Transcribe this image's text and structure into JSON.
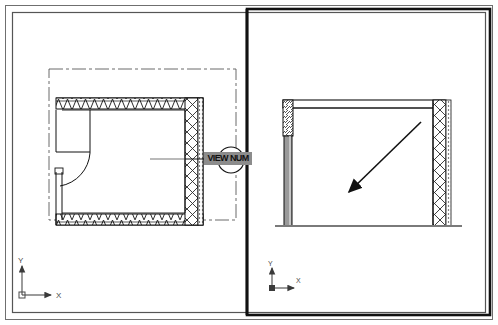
{
  "drawing": {
    "title": "CAD Viewport Drawing",
    "background_color": "#ffffff",
    "line_color": "#1a1a1a",
    "hatch_color": "#2b2b2b",
    "gray_fill": "#8c8c8c",
    "width": 498,
    "height": 325
  },
  "border": {
    "outer_name": "sheet-outer-border",
    "inner_name": "sheet-inner-border"
  },
  "viewports": [
    {
      "id": "left",
      "name": "plan-view-viewport",
      "kind": "plan",
      "ucs": {
        "x_label": "X",
        "y_label": "Y",
        "origin_x": 22,
        "origin_y": 295
      },
      "elements": [
        {
          "name": "centerline-boundary",
          "type": "dash-dot-rectangle"
        },
        {
          "name": "top-wall-truss",
          "type": "zigzag-hatch"
        },
        {
          "name": "bottom-wall-truss",
          "type": "zigzag-hatch"
        },
        {
          "name": "right-wall-lattice",
          "type": "x-lattice-hatch"
        },
        {
          "name": "door-swing-arc",
          "type": "arc"
        }
      ]
    },
    {
      "id": "right",
      "name": "elevation-view-viewport",
      "kind": "elevation",
      "ucs": {
        "x_label": "X",
        "y_label": "Y",
        "origin_x": 270,
        "origin_y": 288
      },
      "elements": [
        {
          "name": "top-beam",
          "type": "beam"
        },
        {
          "name": "left-column-diagonal-hatch",
          "type": "diagonal-hatch"
        },
        {
          "name": "left-column-solid",
          "type": "solid-fill"
        },
        {
          "name": "right-column-lattice",
          "type": "x-lattice-hatch"
        },
        {
          "name": "ground-line",
          "type": "line"
        },
        {
          "name": "leader-arrow",
          "type": "arrow",
          "direction": "down-left"
        }
      ]
    }
  ],
  "callout": {
    "label": "VIEW NUM",
    "name": "view-number-callout",
    "marker_type": "section-bubble"
  }
}
